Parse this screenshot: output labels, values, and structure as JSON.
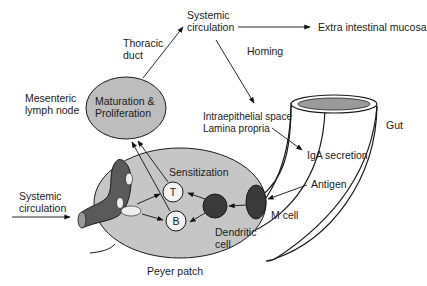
{
  "diagram": {
    "colors": {
      "background": "#ffffff",
      "peyer_patch_fill": "#c6c6c6",
      "lymph_node_fill": "#bdbdbd",
      "dark_cell_fill": "#3a3a3a",
      "vessel_fill": "#5a5a5a",
      "light_cell_fill": "#f2f2f2",
      "stroke": "#1a1a1a",
      "gut_lumen_fill": "#9a9a9a"
    },
    "labels": {
      "systemic_circulation_top": [
        "Systemic",
        "circulation"
      ],
      "extra_intestinal_mucosa": "Extra intestinal mucosa",
      "thoracic_duct": [
        "Thoracic",
        "duct"
      ],
      "homing": "Homing",
      "mesenteric_lymph_node": [
        "Mesenteric",
        "lymph node"
      ],
      "maturation_proliferation": [
        "Maturation &",
        "Proliferation"
      ],
      "intraepithelial_space": "Intraepithelial space",
      "lamina_propria": "Lamina propria",
      "gut": "Gut",
      "iga_secretion": "IgA secretion",
      "sensitization": "Sensitization",
      "antigen": "Antigen",
      "systemic_circulation_left": [
        "Systemic",
        "circulation"
      ],
      "t_cell": "T",
      "b_cell": "B",
      "m_cell": "M cell",
      "dendritic_cell": [
        "Dendritic",
        "cell"
      ],
      "peyer_patch": "Peyer patch"
    },
    "nodes": [
      {
        "id": "systemic_circulation_top",
        "type": "text"
      },
      {
        "id": "extra_intestinal_mucosa",
        "type": "text"
      },
      {
        "id": "mesenteric_lymph_node",
        "type": "ellipse",
        "content": "Maturation & Proliferation"
      },
      {
        "id": "peyer_patch",
        "type": "ellipse",
        "content": "Sensitization"
      },
      {
        "id": "t_cell",
        "type": "circle"
      },
      {
        "id": "b_cell",
        "type": "circle"
      },
      {
        "id": "dendritic_cell",
        "type": "dark-circle"
      },
      {
        "id": "m_cell",
        "type": "dark-ellipse"
      },
      {
        "id": "gut",
        "type": "tube"
      },
      {
        "id": "blood_vessel",
        "type": "vessel"
      }
    ],
    "edges": [
      {
        "from": "antigen",
        "to": "m_cell"
      },
      {
        "from": "m_cell",
        "to": "dendritic_cell"
      },
      {
        "from": "dendritic_cell",
        "to": "t_cell"
      },
      {
        "from": "dendritic_cell",
        "to": "b_cell"
      },
      {
        "from": "blood_vessel",
        "to": "t_cell"
      },
      {
        "from": "blood_vessel",
        "to": "b_cell"
      },
      {
        "from": "t_cell",
        "to": "mesenteric_lymph_node"
      },
      {
        "from": "b_cell",
        "to": "mesenteric_lymph_node"
      },
      {
        "from": "mesenteric_lymph_node",
        "to": "systemic_circulation_top",
        "label": "Thoracic duct"
      },
      {
        "from": "systemic_circulation_top",
        "to": "extra_intestinal_mucosa"
      },
      {
        "from": "systemic_circulation_top",
        "to": "intraepithelial_space",
        "label": "Homing"
      },
      {
        "from": "lamina_propria",
        "to": "iga_secretion"
      },
      {
        "from": "systemic_circulation_left",
        "to": "blood_vessel"
      }
    ]
  }
}
